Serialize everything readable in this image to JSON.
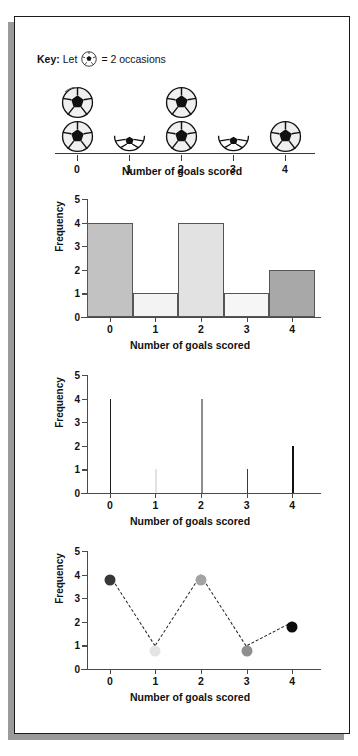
{
  "key": {
    "prefix": "Key:",
    "let_word": "Let",
    "ball_icon": "soccer-ball-icon",
    "equals_text": "= 2 occasions",
    "value_per_symbol": 2
  },
  "axis_titles": {
    "x": "Number of goals scored",
    "y": "Frequency"
  },
  "categories": [
    "0",
    "1",
    "2",
    "3",
    "4"
  ],
  "y_ticks": [
    "0",
    "1",
    "2",
    "3",
    "4",
    "5"
  ],
  "colors": {
    "bar_0": "#c2c2c2",
    "bar_1": "#f3f3f3",
    "bar_2": "#e2e2e2",
    "bar_3": "#f6f6f6",
    "bar_4": "#a8a8a8",
    "line_0": "#1c1c1c",
    "line_1": "#e3e3e3",
    "line_2": "#8e8e8e",
    "line_3": "#3a3a3a",
    "line_4": "#111111",
    "dot_0": "#383838",
    "dot_1": "#e4e4e4",
    "dot_2": "#a3a3a3",
    "dot_3": "#8f8f8f",
    "dot_4": "#0d0d0d",
    "axis": "#4a4a4a",
    "frame": "#1a1a1a",
    "shadow": "#9a9a9a"
  },
  "chart_data": [
    {
      "type": "pictogram",
      "title": "",
      "xlabel": "Number of goals scored",
      "ylabel": "",
      "categories": [
        "0",
        "1",
        "2",
        "3",
        "4"
      ],
      "values": [
        4,
        1,
        4,
        1,
        2
      ],
      "symbols": [
        2,
        0.5,
        2,
        0.5,
        1
      ],
      "symbol_value": 2,
      "symbol": "soccer-ball",
      "legend": "Let soccer ball = 2 occasions"
    },
    {
      "type": "bar",
      "title": "",
      "xlabel": "Number of goals scored",
      "ylabel": "Frequency",
      "categories": [
        "0",
        "1",
        "2",
        "3",
        "4"
      ],
      "values": [
        4,
        1,
        4,
        1,
        2
      ],
      "ylim": [
        0,
        5
      ],
      "yticks": [
        0,
        1,
        2,
        3,
        4,
        5
      ],
      "grid": false,
      "legend": "none"
    },
    {
      "type": "line",
      "subtype": "vertical-line-chart",
      "title": "",
      "xlabel": "Number of goals scored",
      "ylabel": "Frequency",
      "categories": [
        "0",
        "1",
        "2",
        "3",
        "4"
      ],
      "values": [
        4,
        1,
        4,
        1,
        2
      ],
      "ylim": [
        0,
        5
      ],
      "yticks": [
        0,
        1,
        2,
        3,
        4,
        5
      ],
      "grid": false,
      "legend": "none"
    },
    {
      "type": "line",
      "subtype": "dotted-frequency-polygon",
      "title": "",
      "xlabel": "Number of goals scored",
      "ylabel": "Frequency",
      "categories": [
        "0",
        "1",
        "2",
        "3",
        "4"
      ],
      "values": [
        4,
        1,
        4,
        1,
        2
      ],
      "ylim": [
        0,
        5
      ],
      "yticks": [
        0,
        1,
        2,
        3,
        4,
        5
      ],
      "grid": false,
      "line_style": "dashed",
      "markers": true,
      "legend": "none"
    }
  ]
}
